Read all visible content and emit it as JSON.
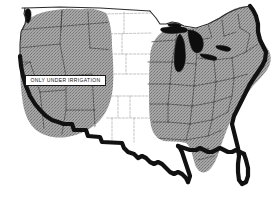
{
  "figure": {
    "type": "thematic-map",
    "width": 279,
    "height": 202,
    "background_color": "#ffffff"
  },
  "callout": {
    "label": "ONLY UNDER IRRIGATION",
    "box_fill": "#ffffff",
    "box_border": "#1a1a1a",
    "text_color": "#111111"
  },
  "legend_colors": {
    "shaded_region": "#9e9e9e",
    "unshaded_region": "#ffffff",
    "coastline": "#111111",
    "great_lakes": "#0d0d0d",
    "state_boundary": "#3a3a3a"
  },
  "regions": [
    {
      "name": "western-shaded-region",
      "fill": "#9e9e9e",
      "note": "ONLY UNDER IRRIGATION"
    },
    {
      "name": "central-unshaded-region",
      "fill": "#ffffff",
      "note": ""
    },
    {
      "name": "eastern-shaded-region",
      "fill": "#9e9e9e",
      "note": ""
    }
  ],
  "features": [
    {
      "name": "great-lakes",
      "fill": "#0d0d0d"
    },
    {
      "name": "pacific-coastline",
      "fill": "#111111"
    },
    {
      "name": "gulf-coastline",
      "fill": "#111111"
    },
    {
      "name": "atlantic-coastline",
      "fill": "#111111"
    },
    {
      "name": "mexican-border",
      "fill": "#111111"
    }
  ]
}
